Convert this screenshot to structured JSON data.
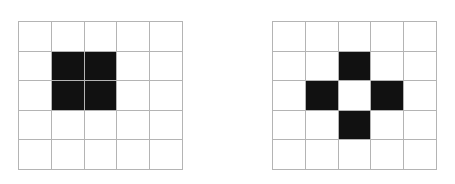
{
  "figure": {
    "background_color": "#ffffff",
    "grid_line_color": "#b4b4b4",
    "filled_cell_color": "#111111",
    "empty_cell_color": "#ffffff",
    "panel_count": 2
  },
  "chart_data": {
    "type": "heatmap",
    "title": "",
    "subtitle": "",
    "xlabel": "",
    "ylabel": "",
    "grid": true,
    "legend": "none",
    "rows": 5,
    "cols": 5,
    "value_labels": {
      "0": "white",
      "1": "black"
    },
    "panels": [
      {
        "name": "left-grid",
        "label": "",
        "rows": 5,
        "cols": 5,
        "filled_count": 4,
        "shape": "2x2 square block",
        "filled_cells": [
          [
            1,
            1
          ],
          [
            1,
            2
          ],
          [
            2,
            1
          ],
          [
            2,
            2
          ]
        ],
        "matrix": [
          [
            0,
            0,
            0,
            0,
            0
          ],
          [
            0,
            1,
            1,
            0,
            0
          ],
          [
            0,
            1,
            1,
            0,
            0
          ],
          [
            0,
            0,
            0,
            0,
            0
          ],
          [
            0,
            0,
            0,
            0,
            0
          ]
        ]
      },
      {
        "name": "right-grid",
        "label": "",
        "rows": 5,
        "cols": 5,
        "filled_count": 4,
        "shape": "hollow plus / diamond",
        "filled_cells": [
          [
            1,
            2
          ],
          [
            2,
            1
          ],
          [
            2,
            3
          ],
          [
            3,
            2
          ]
        ],
        "matrix": [
          [
            0,
            0,
            0,
            0,
            0
          ],
          [
            0,
            0,
            1,
            0,
            0
          ],
          [
            0,
            1,
            0,
            1,
            0
          ],
          [
            0,
            0,
            1,
            0,
            0
          ],
          [
            0,
            0,
            0,
            0,
            0
          ]
        ]
      }
    ]
  }
}
